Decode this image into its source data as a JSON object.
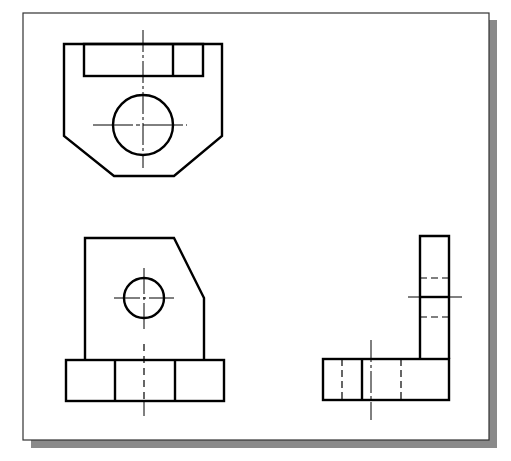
{
  "drawing": {
    "title": "Orthographic views",
    "colors": {
      "background": "#ffffff",
      "line": "#000000",
      "frame_border": "#333333",
      "shadow": "#8a8a8a"
    },
    "views": [
      {
        "name": "top-view"
      },
      {
        "name": "front-view"
      },
      {
        "name": "right-side-view"
      }
    ]
  }
}
